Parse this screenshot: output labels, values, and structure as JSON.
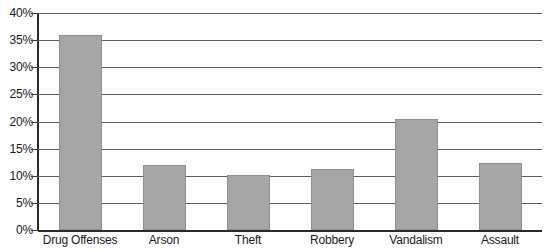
{
  "chart_data": {
    "type": "bar",
    "title": "",
    "xlabel": "",
    "ylabel": "",
    "categories": [
      "Drug Offenses",
      "Arson",
      "Theft",
      "Robbery",
      "Vandalism",
      "Assault"
    ],
    "values": [
      36.0,
      12.0,
      10.2,
      11.2,
      20.4,
      12.4
    ],
    "ylim": [
      0,
      40
    ],
    "ytick_labels": [
      "0%",
      "5%",
      "10%",
      "15%",
      "20%",
      "25%",
      "30%",
      "35%",
      "40%"
    ],
    "ytick_values": [
      0,
      5,
      10,
      15,
      20,
      25,
      30,
      35,
      40
    ],
    "grid": true,
    "legend": "none",
    "series": [
      {
        "name": "Percent",
        "values": [
          36.0,
          12.0,
          10.2,
          11.2,
          20.4,
          12.4
        ]
      }
    ],
    "bar_color": "#a6a6a6",
    "gridline_color": "#5d5d5d",
    "axis_color": "#2a2a2a",
    "text_color": "#1b1b1b"
  }
}
